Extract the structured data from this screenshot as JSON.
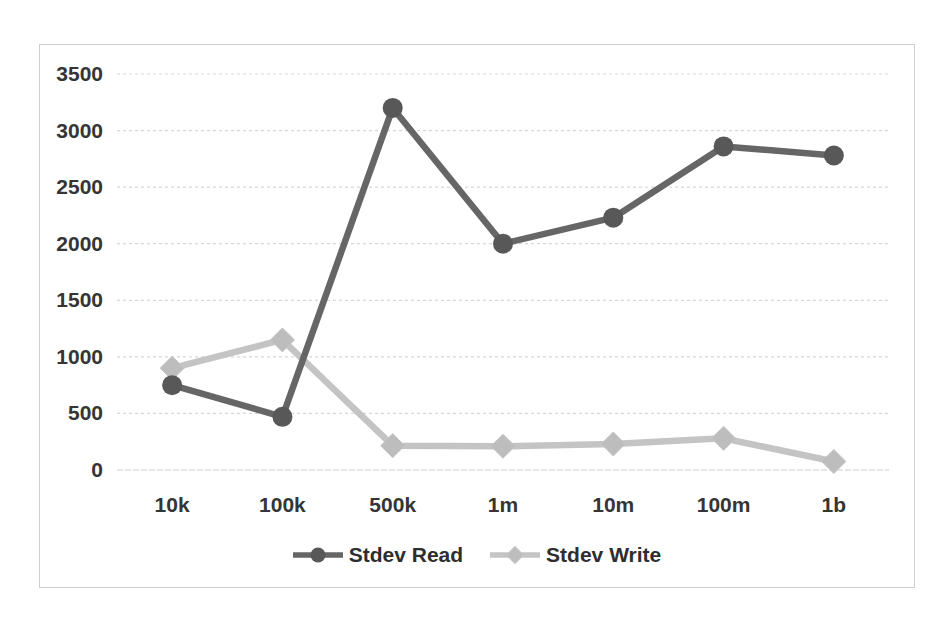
{
  "chart_data": {
    "type": "line",
    "title": "",
    "xlabel": "",
    "ylabel": "",
    "categories": [
      "10k",
      "100k",
      "500k",
      "1m",
      "10m",
      "100m",
      "1b"
    ],
    "series": [
      {
        "name": "Stdev Read",
        "marker": "circle",
        "color": "#666666",
        "marker_color": "#585858",
        "values": [
          750,
          470,
          3200,
          2000,
          2230,
          2860,
          2780
        ]
      },
      {
        "name": "Stdev Write",
        "marker": "diamond",
        "color": "#c4c4c4",
        "marker_color": "#bdbdbd",
        "values": [
          900,
          1150,
          215,
          210,
          230,
          280,
          75
        ]
      }
    ],
    "ylim": [
      0,
      3500
    ],
    "yticks": [
      0,
      500,
      1000,
      1500,
      2000,
      2500,
      3000,
      3500
    ],
    "grid": "horizontal-dotted",
    "legend_position": "bottom-center"
  },
  "styles": {
    "text_color": "#353535",
    "grid_color": "#d7d7d7",
    "zero_line_color": "#cccccc",
    "frame_border_color": "#cfcfcf",
    "background": "#ffffff"
  }
}
